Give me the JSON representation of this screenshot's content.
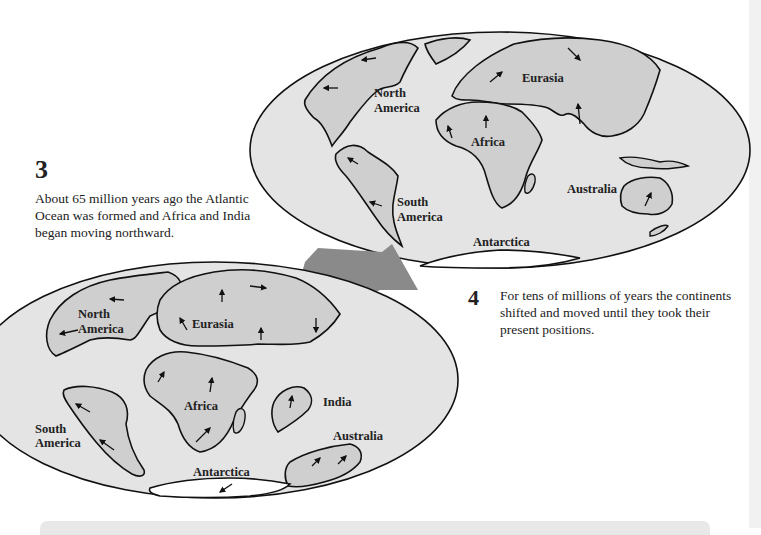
{
  "step3": {
    "number": "3",
    "text": "About 65 million years ago the Atlantic Ocean was formed and Africa and India began moving northward."
  },
  "step4": {
    "number": "4",
    "text": "For tens of millions of years the continents shifted and moved until they took their present positions."
  },
  "map_past": {
    "labels": {
      "north_america_1": "North",
      "north_america_2": "America",
      "eurasia": "Eurasia",
      "africa": "Africa",
      "india": "India",
      "south_america_1": "South",
      "south_america_2": "America",
      "australia": "Australia",
      "antarctica": "Antarctica"
    }
  },
  "map_present": {
    "labels": {
      "north_america_1": "North",
      "north_america_2": "America",
      "eurasia": "Eurasia",
      "africa": "Africa",
      "south_america_1": "South",
      "south_america_2": "America",
      "australia": "Australia",
      "antarctica": "Antarctica"
    }
  },
  "colors": {
    "ocean": "#e4e4e4",
    "land": "#cfcfcf",
    "outline": "#111111",
    "transition_arrow": "#8a8a8a"
  }
}
